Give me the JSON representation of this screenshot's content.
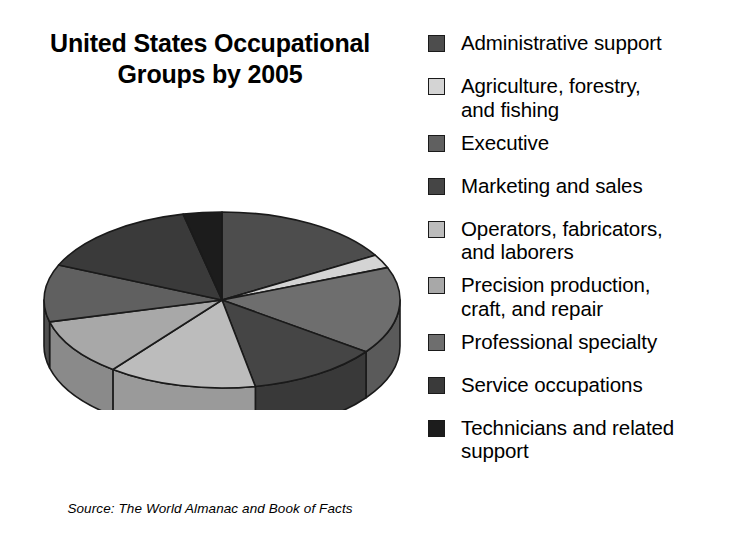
{
  "chart_data": {
    "type": "pie",
    "xlabel": "",
    "ylabel": "",
    "legend_position": "right",
    "three_d": true,
    "source": "Source: The World Almanac and Book of Facts",
    "categories": [
      "Administrative support",
      "Agriculture, forestry,\nand fishing",
      "Executive",
      "Marketing and sales",
      "Operators, fabricators,\nand laborers",
      "Precision production,\ncraft, and repair",
      "Professional specialty",
      "Service occupations",
      "Technicians and related\nsupport"
    ],
    "values": [
      16.5,
      2.5,
      10.5,
      12.0,
      13.5,
      10.5,
      16.0,
      15.0,
      3.5
    ],
    "colors": [
      "#4d4d4d",
      "#d4d4d4",
      "#606060",
      "#454545",
      "#bcbcbc",
      "#a8a8a8",
      "#6e6e6e",
      "#3a3a3a",
      "#1c1c1c"
    ],
    "slice_order_clockwise_from_top": [
      "Administrative support",
      "Agriculture, forestry, and fishing",
      "Professional specialty",
      "Marketing and sales",
      "Operators, fabricators, and laborers",
      "Precision production, craft, and repair",
      "Executive",
      "Service occupations",
      "Technicians and related support"
    ]
  },
  "title": {
    "line1": "United States Occupational",
    "line2": "Groups by 2005",
    "text": "United States Occupational\nGroups by 2005"
  },
  "source": {
    "text": "Source: The World Almanac and Book of Facts"
  },
  "legend": {
    "items": [
      {
        "label": "Administrative support",
        "color": "#4d4d4d"
      },
      {
        "label": "Agriculture, forestry,\nand fishing",
        "color": "#d4d4d4"
      },
      {
        "label": "Executive",
        "color": "#606060"
      },
      {
        "label": "Marketing and sales",
        "color": "#454545"
      },
      {
        "label": "Operators, fabricators,\nand laborers",
        "color": "#bcbcbc"
      },
      {
        "label": "Precision production,\ncraft, and repair",
        "color": "#a8a8a8"
      },
      {
        "label": "Professional specialty",
        "color": "#6e6e6e"
      },
      {
        "label": "Service occupations",
        "color": "#3a3a3a"
      },
      {
        "label": "Technicians and related\nsupport",
        "color": "#1c1c1c"
      }
    ]
  },
  "colors": {
    "background": "#ffffff",
    "text": "#000000",
    "outline": "#1a1a1a",
    "shadow": "#b9b9b9"
  }
}
